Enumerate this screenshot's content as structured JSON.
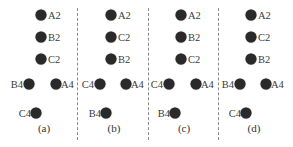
{
  "figure": {
    "panels": [
      {
        "id": "a",
        "caption": "(a)",
        "top_labels": [
          "A2",
          "B2",
          "C2"
        ],
        "left_mid": "B4",
        "right_mid": "A4",
        "bottom": "C4"
      },
      {
        "id": "b",
        "caption": "(b)",
        "top_labels": [
          "A2",
          "C2",
          "B2"
        ],
        "left_mid": "C4",
        "right_mid": "A4",
        "bottom": "B4"
      },
      {
        "id": "c",
        "caption": "(c)",
        "top_labels": [
          "A2",
          "B2",
          "C2"
        ],
        "left_mid": "C4",
        "right_mid": "A4",
        "bottom": "B4"
      },
      {
        "id": "d",
        "caption": "(d)",
        "top_labels": [
          "A2",
          "C2",
          "B2"
        ],
        "left_mid": "B4",
        "right_mid": "A4",
        "bottom": "C4"
      }
    ],
    "dot_color": "#2a2a2a",
    "divider_color": "#8a8a8a"
  }
}
